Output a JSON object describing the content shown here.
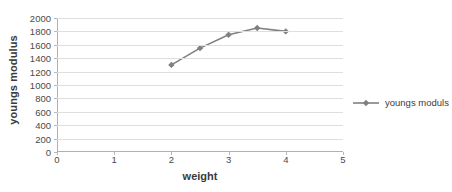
{
  "chart_data": {
    "type": "line",
    "title": "",
    "xlabel": "weight",
    "ylabel": "youngs modulus",
    "xlim": [
      0,
      5
    ],
    "ylim": [
      0,
      2000
    ],
    "x_ticks": [
      "0",
      "1",
      "2",
      "3",
      "4",
      "5"
    ],
    "x_tick_values": [
      0,
      1,
      2,
      3,
      4,
      5
    ],
    "y_ticks": [
      "0",
      "200",
      "400",
      "600",
      "800",
      "1000",
      "1200",
      "1400",
      "1600",
      "1800",
      "2000"
    ],
    "y_tick_values": [
      0,
      200,
      400,
      600,
      800,
      1000,
      1200,
      1400,
      1600,
      1800,
      2000
    ],
    "grid": true,
    "grid_axis": "y",
    "legend_position": "right",
    "series": [
      {
        "name": "youngs moduls",
        "x": [
          2,
          2.5,
          3,
          3.5,
          4
        ],
        "values": [
          1300,
          1550,
          1750,
          1850,
          1800
        ],
        "color": "#808080",
        "marker": "diamond"
      }
    ]
  },
  "legend": {
    "entries": [
      {
        "label": "youngs moduls",
        "color": "#808080"
      }
    ]
  },
  "axes": {
    "x_title": "weight",
    "y_title": "youngs modulus"
  },
  "colors": {
    "series": "#808080",
    "gridline": "#dedede",
    "axis": "#b0b0b0",
    "text": "#3b3b3b",
    "tick_text": "#4a4a4a",
    "background": "#ffffff"
  }
}
